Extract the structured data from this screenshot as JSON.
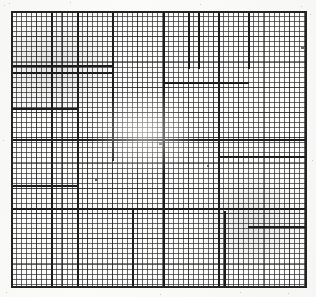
{
  "document": {
    "kind": "scanned-graph-paper",
    "title": "Ruled graph paper scan",
    "width_px": 316,
    "height_px": 297,
    "background_color": "#fdfdfc",
    "paper_color": "#fbfbf9",
    "fine_rule_color": "#28282a",
    "heavy_rule_color": "#1c1c1e",
    "frame_color": "#232325"
  },
  "grid": {
    "name": "fine-ruling",
    "origin_x": 11,
    "origin_y": 11,
    "width": 296,
    "height": 277,
    "cell_size_px": 5.05,
    "minor_every": 5,
    "columns": 59,
    "rows": 55,
    "fine_line_width_px": 1,
    "heavy_line_width_px": 2
  },
  "heavy_vertical_rules": [
    {
      "x": 0,
      "y": 0,
      "length": 277,
      "weight": 2
    },
    {
      "x": 40,
      "y": 0,
      "length": 277,
      "weight": 2
    },
    {
      "x": 66,
      "y": 0,
      "length": 277,
      "weight": 2
    },
    {
      "x": 101,
      "y": 0,
      "length": 150,
      "weight": 2
    },
    {
      "x": 152,
      "y": 0,
      "length": 277,
      "weight": 2
    },
    {
      "x": 177,
      "y": 0,
      "length": 58,
      "weight": 2
    },
    {
      "x": 187,
      "y": 0,
      "length": 58,
      "weight": 2
    },
    {
      "x": 207,
      "y": 0,
      "length": 277,
      "weight": 2
    },
    {
      "x": 237,
      "y": 0,
      "length": 58,
      "weight": 2
    },
    {
      "x": 213,
      "y": 200,
      "length": 77,
      "weight": 2
    },
    {
      "x": 152,
      "y": 197,
      "length": 80,
      "weight": 2
    },
    {
      "x": 121,
      "y": 197,
      "length": 80,
      "weight": 2
    },
    {
      "x": 66,
      "y": 128,
      "length": 149,
      "weight": 2
    },
    {
      "x": 294,
      "y": 0,
      "length": 277,
      "weight": 2
    }
  ],
  "heavy_horizontal_rules": [
    {
      "y": 0,
      "x": 0,
      "length": 296,
      "weight": 2
    },
    {
      "y": 54,
      "x": 0,
      "length": 101,
      "weight": 2
    },
    {
      "y": 61,
      "x": 0,
      "length": 101,
      "weight": 2
    },
    {
      "y": 71,
      "x": 152,
      "length": 86,
      "weight": 2
    },
    {
      "y": 97,
      "x": 0,
      "length": 66,
      "weight": 2
    },
    {
      "y": 128,
      "x": 0,
      "length": 296,
      "weight": 2
    },
    {
      "y": 145,
      "x": 207,
      "length": 87,
      "weight": 2
    },
    {
      "y": 174,
      "x": 0,
      "length": 66,
      "weight": 2
    },
    {
      "y": 197,
      "x": 0,
      "length": 296,
      "weight": 2
    },
    {
      "y": 215,
      "x": 237,
      "length": 57,
      "weight": 2
    },
    {
      "y": 275,
      "x": 0,
      "length": 296,
      "weight": 2
    }
  ],
  "stray_marks": [
    {
      "x": 148,
      "y": 132,
      "w": 3,
      "h": 2
    },
    {
      "x": 290,
      "y": 36,
      "w": 3,
      "h": 2
    },
    {
      "x": 196,
      "y": 154,
      "w": 2,
      "h": 2
    },
    {
      "x": 84,
      "y": 168,
      "w": 2,
      "h": 2
    }
  ]
}
